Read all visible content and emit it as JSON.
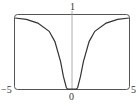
{
  "chart_data": {
    "type": "line",
    "title": "",
    "xlabel": "",
    "ylabel": "",
    "xlim": [
      -5,
      5
    ],
    "ylim": [
      0,
      1
    ],
    "grid": false,
    "series": [
      {
        "name": "f(x)",
        "x": [
          -5,
          -4,
          -3,
          -2,
          -1.5,
          -1,
          -0.75,
          -0.5,
          -0.4,
          -0.3,
          0,
          0.3,
          0.4,
          0.5,
          0.75,
          1,
          1.5,
          2,
          3,
          4,
          5
        ],
        "y": [
          0.96,
          0.94,
          0.89,
          0.78,
          0.64,
          0.37,
          0.17,
          0.02,
          0.002,
          0,
          0,
          0,
          0.002,
          0.02,
          0.17,
          0.37,
          0.64,
          0.78,
          0.89,
          0.94,
          0.96
        ]
      }
    ],
    "tick_labels": {
      "x_left": "−5",
      "x_center": "0",
      "x_right": "5",
      "y_top": "1"
    }
  },
  "colors": {
    "curve": "#333333",
    "frame": "#555555",
    "axis": "#999999"
  }
}
